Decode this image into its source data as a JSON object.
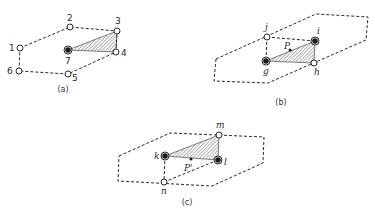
{
  "panels": [
    {
      "id": "a",
      "caption": "(a)",
      "caption_pos": [
        63,
        92
      ],
      "outline": [
        [
          20,
          48
        ],
        [
          70,
          27
        ],
        [
          117,
          31
        ],
        [
          116,
          52
        ],
        [
          68,
          74
        ],
        [
          19,
          71
        ]
      ],
      "triangle": [
        [
          68,
          50
        ],
        [
          117,
          31
        ],
        [
          116,
          52
        ]
      ],
      "open_nodes": [
        {
          "label": "1",
          "x": 20,
          "y": 48,
          "lx": 9,
          "ly": 51
        },
        {
          "label": "2",
          "x": 70,
          "y": 27,
          "lx": 67,
          "ly": 21
        },
        {
          "label": "3",
          "x": 117,
          "y": 31,
          "lx": 115,
          "ly": 24
        },
        {
          "label": "4",
          "x": 116,
          "y": 52,
          "lx": 121,
          "ly": 56
        },
        {
          "label": "5",
          "x": 68,
          "y": 74,
          "lx": 72,
          "ly": 81
        },
        {
          "label": "6",
          "x": 19,
          "y": 71,
          "lx": 7,
          "ly": 74
        }
      ],
      "filled_nodes": [
        {
          "label": "7",
          "x": 68,
          "y": 50,
          "lx": 65,
          "ly": 64
        }
      ],
      "points": []
    },
    {
      "id": "b",
      "caption": "(b)",
      "caption_pos": [
        281,
        105
      ],
      "outline": [
        [
          216,
          59
        ],
        [
          316,
          14
        ],
        [
          368,
          17
        ],
        [
          366,
          40
        ],
        [
          268,
          83
        ],
        [
          214,
          81
        ]
      ],
      "inner_lines": [
        [
          [
            267,
            37
          ],
          [
            315,
            41
          ]
        ],
        [
          [
            267,
            37
          ],
          [
            266,
            61
          ]
        ]
      ],
      "triangle": [
        [
          266,
          61
        ],
        [
          315,
          41
        ],
        [
          314,
          63
        ]
      ],
      "open_nodes": [
        {
          "label": "j",
          "x": 267,
          "y": 37,
          "lx": 265,
          "ly": 30
        },
        {
          "label": "h",
          "x": 314,
          "y": 63,
          "lx": 314,
          "ly": 75
        }
      ],
      "filled_nodes": [
        {
          "label": "i",
          "x": 315,
          "y": 41,
          "lx": 317,
          "ly": 34
        },
        {
          "label": "g",
          "x": 266,
          "y": 61,
          "lx": 263,
          "ly": 74
        }
      ],
      "points": [
        {
          "label": "P",
          "x": 290,
          "y": 50,
          "lx": 284,
          "ly": 49
        }
      ]
    },
    {
      "id": "c",
      "caption": "(c)",
      "caption_pos": [
        187,
        205
      ],
      "outline": [
        [
          119,
          156
        ],
        [
          170,
          133
        ],
        [
          264,
          137
        ],
        [
          263,
          163
        ],
        [
          212,
          186
        ],
        [
          118,
          181
        ]
      ],
      "inner_lines": [
        [
          [
            165,
            156
          ],
          [
            164,
            182
          ]
        ],
        [
          [
            164,
            182
          ],
          [
            218,
            160
          ]
        ]
      ],
      "triangle": [
        [
          165,
          156
        ],
        [
          219,
          135
        ],
        [
          218,
          160
        ]
      ],
      "open_nodes": [
        {
          "label": "m",
          "x": 219,
          "y": 135,
          "lx": 216,
          "ly": 128
        },
        {
          "label": "n",
          "x": 164,
          "y": 182,
          "lx": 161,
          "ly": 194
        }
      ],
      "filled_nodes": [
        {
          "label": "k",
          "x": 165,
          "y": 156,
          "lx": 154,
          "ly": 159
        },
        {
          "label": "l",
          "x": 218,
          "y": 160,
          "lx": 224,
          "ly": 165
        }
      ],
      "points": [
        {
          "label": "P'",
          "x": 191,
          "y": 159,
          "lx": 184,
          "ly": 171
        }
      ]
    }
  ]
}
